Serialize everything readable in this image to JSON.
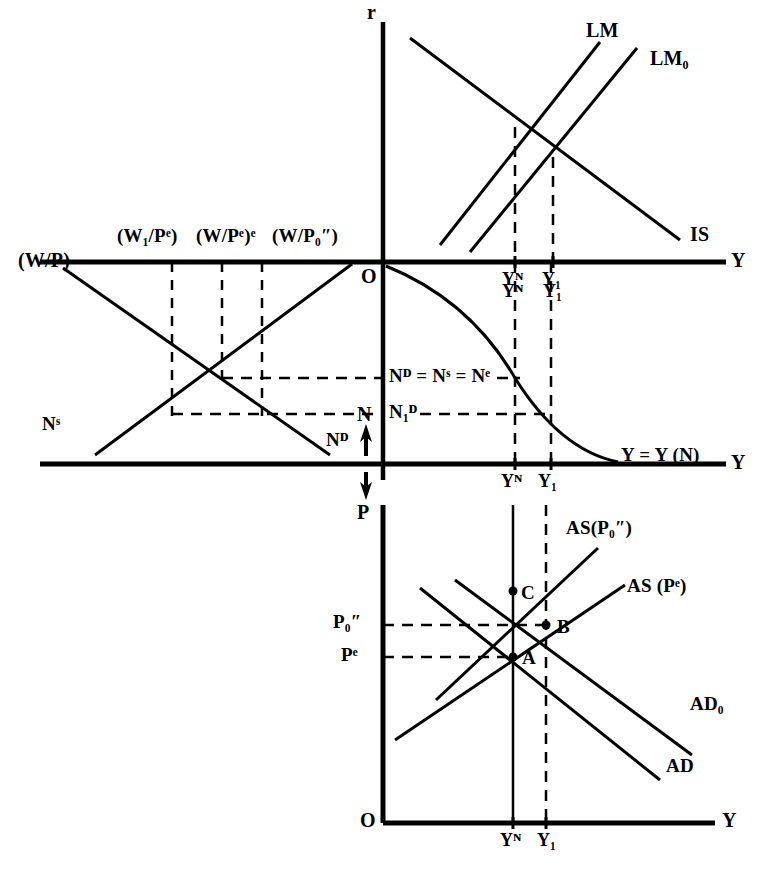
{
  "figure": {
    "kind": "four-quadrant macroeconomic model"
  },
  "axes": {
    "interest_rate_axis_label": "r",
    "real_wage_axis_label": "(W/P)",
    "output_axis_top_label": "Y",
    "output_axis_middle_label": "Y",
    "output_axis_bottom_label": "Y",
    "employment_axis_label": "N",
    "price_axis_label": "P",
    "origin_top_label": "O",
    "origin_bottom_label": "O"
  },
  "panel_islm": {
    "curves": [
      {
        "name": "LM",
        "label": "LM"
      },
      {
        "name": "LM0",
        "label": "LM₀"
      },
      {
        "name": "IS",
        "label": "IS"
      }
    ],
    "tick_labels": [
      {
        "id": "yn",
        "label": "Yᴺ"
      },
      {
        "id": "y1",
        "label": "Y₁"
      }
    ]
  },
  "panel_labour": {
    "real_wage_ticks": [
      {
        "id": "w1pe",
        "label": "(W₁/Pᵉ)"
      },
      {
        "id": "wpee",
        "label": "(W/Pᵉ)ᵉ"
      },
      {
        "id": "wp0",
        "label": "(W/P₀″)"
      }
    ],
    "curves": [
      {
        "name": "labour-supply",
        "label": "Nˢ"
      },
      {
        "name": "labour-demand",
        "label": "Nᴰ"
      }
    ],
    "employment_levels": [
      {
        "id": "equilibrium",
        "label": "Nᴰ = Nˢ = Nᵉ"
      },
      {
        "id": "n1d",
        "label": "N₁ᴰ"
      }
    ]
  },
  "panel_production": {
    "curve_label": "Y = Y (N)",
    "tick_labels": [
      {
        "id": "yn",
        "label": "Yᴺ"
      },
      {
        "id": "y1",
        "label": "Y₁"
      }
    ]
  },
  "panel_adas": {
    "curves": [
      {
        "name": "AS-P0",
        "label": "AS(P₀″)"
      },
      {
        "name": "AS-Pe",
        "label": "AS (Pᵉ)"
      },
      {
        "name": "AD0",
        "label": "AD₀"
      },
      {
        "name": "AD",
        "label": "AD"
      }
    ],
    "price_ticks": [
      {
        "id": "p0",
        "label": "P₀″"
      },
      {
        "id": "pe",
        "label": "Pᵉ"
      }
    ],
    "equilibrium_points": [
      {
        "id": "A",
        "label": "A"
      },
      {
        "id": "B",
        "label": "B"
      },
      {
        "id": "C",
        "label": "C"
      }
    ],
    "tick_labels": [
      {
        "id": "yn",
        "label": "Yᴺ"
      },
      {
        "id": "y1",
        "label": "Y₁"
      }
    ]
  },
  "colors": {
    "ink": "#000000",
    "paper": "#ffffff"
  }
}
